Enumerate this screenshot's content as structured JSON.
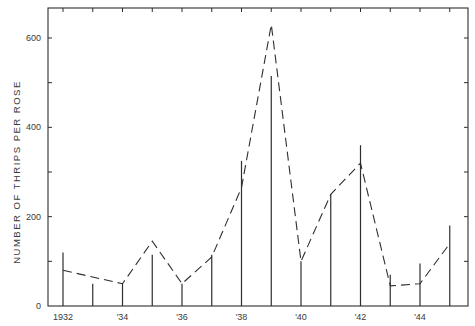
{
  "chart_data": {
    "type": "line",
    "title": "",
    "xlabel": "",
    "ylabel": "NUMBER OF THRIPS PER ROSE",
    "ylim": [
      0,
      660
    ],
    "xlim": [
      1931.5,
      1945.8
    ],
    "grid": false,
    "legend": null,
    "y_ticks": [
      0,
      100,
      200,
      300,
      400,
      500,
      600
    ],
    "y_tick_labels": [
      "0",
      "",
      "200",
      "",
      "400",
      "",
      "600"
    ],
    "x_ticks": [
      1932,
      1933,
      1934,
      1935,
      1936,
      1937,
      1938,
      1939,
      1940,
      1941,
      1942,
      1943,
      1944,
      1945
    ],
    "x_tick_labels": [
      "1932",
      "",
      "'34",
      "",
      "'36",
      "",
      "'38",
      "",
      "'40",
      "",
      "'42",
      "",
      "'44",
      ""
    ],
    "x": [
      1932,
      1933,
      1934,
      1935,
      1936,
      1937,
      1938,
      1939,
      1940,
      1941,
      1942,
      1943,
      1944,
      1945
    ],
    "series": [
      {
        "name": "observed (vertical lines)",
        "style": "solid-vertical-line",
        "values": [
          120,
          50,
          50,
          115,
          50,
          115,
          325,
          515,
          100,
          250,
          360,
          70,
          95,
          180
        ]
      },
      {
        "name": "predicted (dashed line)",
        "style": "dashed",
        "x": [
          1932,
          1934,
          1935,
          1936,
          1937,
          1938,
          1939,
          1940,
          1941,
          1942,
          1943,
          1944,
          1945
        ],
        "values": [
          80,
          50,
          145,
          50,
          110,
          265,
          630,
          100,
          250,
          320,
          45,
          50,
          140
        ]
      }
    ]
  },
  "colors": {
    "ink": "#2e2e2e",
    "background": "#ffffff"
  }
}
